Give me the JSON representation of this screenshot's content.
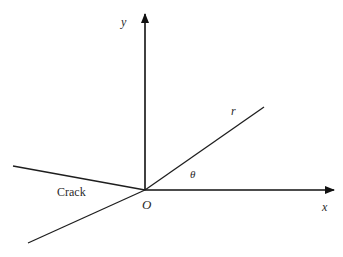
{
  "diagram": {
    "origin": {
      "label": "O",
      "x": 145,
      "y": 190
    },
    "axes": {
      "x": {
        "label": "x",
        "from": [
          145,
          190
        ],
        "to": [
          335,
          190
        ]
      },
      "y": {
        "label": "y",
        "from": [
          145,
          190
        ],
        "to": [
          145,
          13
        ]
      }
    },
    "radius": {
      "label": "r",
      "from": [
        145,
        190
      ],
      "to": [
        264,
        107
      ]
    },
    "angle": {
      "label": "θ"
    },
    "crack": {
      "label": "Crack",
      "upper_face": {
        "from": [
          13,
          166
        ],
        "to": [
          145,
          190
        ]
      },
      "lower_face": {
        "from": [
          28,
          243
        ],
        "to": [
          145,
          190
        ]
      }
    },
    "colors": {
      "line": "#1e1e1e",
      "text": "#2a2a2a",
      "background": "#ffffff"
    }
  }
}
